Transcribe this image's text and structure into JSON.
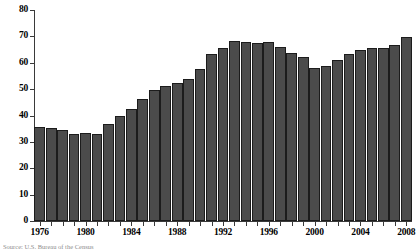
{
  "chart_data": {
    "type": "bar",
    "title": "",
    "subtitle": "",
    "xlabel": "",
    "ylabel": "",
    "ylim": [
      0,
      80
    ],
    "y_ticks": [
      0,
      10,
      20,
      30,
      40,
      50,
      60,
      70,
      80
    ],
    "x_tick_labels": [
      "1976",
      "1980",
      "1984",
      "1988",
      "1992",
      "1996",
      "2000",
      "2004",
      "2008"
    ],
    "grid": false,
    "legend": "none",
    "bar_color": "#4b4b4b",
    "bar_edge_color": "#1c1c1c",
    "axis_color": "#3a3a3a",
    "categories": [
      "1976",
      "1977",
      "1978",
      "1979",
      "1980",
      "1981",
      "1982",
      "1983",
      "1984",
      "1985",
      "1986",
      "1987",
      "1988",
      "1989",
      "1990",
      "1991",
      "1992",
      "1993",
      "1994",
      "1995",
      "1996",
      "1997",
      "1998",
      "1999",
      "2000",
      "2001",
      "2002",
      "2003",
      "2004",
      "2005",
      "2006",
      "2007",
      "2008"
    ],
    "values": [
      35.5,
      35.2,
      34.4,
      33.0,
      33.2,
      32.9,
      36.8,
      39.9,
      42.3,
      46.3,
      49.7,
      51.2,
      52.4,
      53.8,
      57.8,
      63.2,
      65.7,
      68.2,
      67.8,
      67.4,
      68.0,
      66.1,
      63.8,
      62.0,
      58.0,
      58.8,
      61.0,
      63.4,
      64.8,
      65.5,
      65.5,
      66.8,
      69.8
    ]
  },
  "caption": {
    "text": "Source: U.S. Bureau of the Census"
  }
}
